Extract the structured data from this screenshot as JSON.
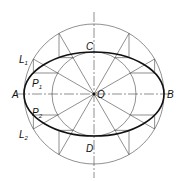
{
  "diagram": {
    "center": {
      "x": 94,
      "y": 94
    },
    "outer_radius": 70,
    "inner_radius": 42,
    "labels": {
      "A": "A",
      "B": "B",
      "C": "C",
      "D": "D",
      "O": "O",
      "L1": "L",
      "L1_sub": "1",
      "L2": "L",
      "L2_sub": "2",
      "P1": "P",
      "P1_sub": "1",
      "P2": "P",
      "P2_sub": "2"
    },
    "colors": {
      "line": "#333333",
      "ellipse": "#111111"
    }
  }
}
